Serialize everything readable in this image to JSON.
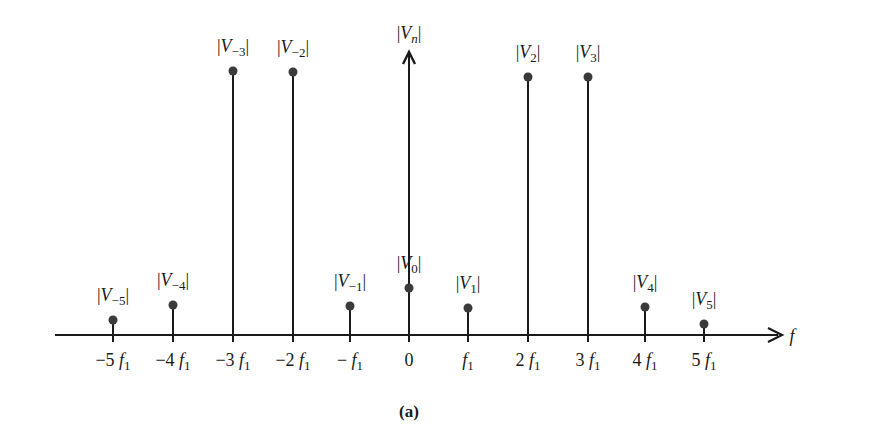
{
  "figure": {
    "caption": "(a)",
    "axis_label": "f",
    "vertical_axis_label": "|V_n|"
  },
  "chart_data": {
    "type": "stem",
    "title": "",
    "xlabel": "f",
    "ylabel": "|V_n|",
    "categories": [
      "-5f1",
      "-4f1",
      "-3f1",
      "-2f1",
      "-f1",
      "0",
      "f1",
      "2f1",
      "3f1",
      "4f1",
      "5f1"
    ],
    "x_tick_labels": [
      "−5 f₁",
      "−4 f₁",
      "−3 f₁",
      "−2 f₁",
      "−f₁",
      "0",
      "f₁",
      "2 f₁",
      "3 f₁",
      "4 f₁",
      "5 f₁"
    ],
    "series": [
      {
        "name": "|V_n|",
        "labels": [
          "|V−5|",
          "|V−4|",
          "|V−3|",
          "|V−2|",
          "|V−1|",
          "|V0|",
          "|V1|",
          "|V2|",
          "|V3|",
          "|V4|",
          "|V5|"
        ],
        "values": [
          0.05,
          0.11,
          0.98,
          0.98,
          0.11,
          0.18,
          0.1,
          0.96,
          0.96,
          0.11,
          0.04
        ]
      }
    ],
    "grid": false,
    "legend": "none",
    "note": "relative magnitudes estimated from stem heights; axis is unscaled"
  },
  "stems": [
    {
      "n": "-5",
      "label_main": "V",
      "label_sub": "−5",
      "tick_pre": "−5",
      "tick_f": "f",
      "tick_sub": "1",
      "x": 113,
      "tip": 320
    },
    {
      "n": "-4",
      "label_main": "V",
      "label_sub": "−4",
      "tick_pre": "−4",
      "tick_f": "f",
      "tick_sub": "1",
      "x": 173,
      "tip": 305
    },
    {
      "n": "-3",
      "label_main": "V",
      "label_sub": "−3",
      "tick_pre": "−3",
      "tick_f": "f",
      "tick_sub": "1",
      "x": 233,
      "tip": 71
    },
    {
      "n": "-2",
      "label_main": "V",
      "label_sub": "−2",
      "tick_pre": "−2",
      "tick_f": "f",
      "tick_sub": "1",
      "x": 293,
      "tip": 72
    },
    {
      "n": "-1",
      "label_main": "V",
      "label_sub": "−1",
      "tick_pre": "−",
      "tick_f": "f",
      "tick_sub": "1",
      "x": 350,
      "tip": 306
    },
    {
      "n": "0",
      "label_main": "V",
      "label_sub": "0",
      "tick_pre": "0",
      "tick_f": "",
      "tick_sub": "",
      "x": 409,
      "tip": 288
    },
    {
      "n": "1",
      "label_main": "V",
      "label_sub": "1",
      "tick_pre": "",
      "tick_f": "f",
      "tick_sub": "1",
      "x": 468,
      "tip": 308
    },
    {
      "n": "2",
      "label_main": "V",
      "label_sub": "2",
      "tick_pre": "2",
      "tick_f": "f",
      "tick_sub": "1",
      "x": 528,
      "tip": 77
    },
    {
      "n": "3",
      "label_main": "V",
      "label_sub": "3",
      "tick_pre": "3",
      "tick_f": "f",
      "tick_sub": "1",
      "x": 588,
      "tip": 77
    },
    {
      "n": "4",
      "label_main": "V",
      "label_sub": "4",
      "tick_pre": "4",
      "tick_f": "f",
      "tick_sub": "1",
      "x": 645,
      "tip": 307
    },
    {
      "n": "5",
      "label_main": "V",
      "label_sub": "5",
      "tick_pre": "5",
      "tick_f": "f",
      "tick_sub": "1",
      "x": 704,
      "tip": 324
    }
  ],
  "colors": {
    "ink": "#1a1a1a",
    "dot": "#3a3a3a"
  }
}
